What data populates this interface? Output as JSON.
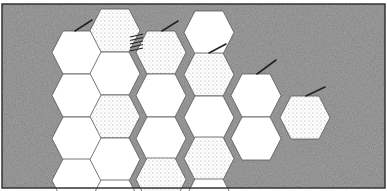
{
  "figure": {
    "title": "",
    "frame": {
      "x": 2,
      "y": 4,
      "width": 383,
      "height": 184
    },
    "colors": {
      "background": "#9a9a9a",
      "background_dark": "#7e7e7e",
      "cell_white": "#ffffff",
      "cell_dotted": "#e6e6e6",
      "cell_outline": "#555555",
      "frame_border": "#333333",
      "stroke": "#222222"
    },
    "hex": {
      "width": 50,
      "height": 43
    },
    "cells": [
      {
        "col": 1,
        "x": 52,
        "y": 31,
        "fill": "white"
      },
      {
        "col": 1,
        "x": 52,
        "y": 74,
        "fill": "white"
      },
      {
        "col": 1,
        "x": 52,
        "y": 117,
        "fill": "white"
      },
      {
        "col": 1,
        "x": 52,
        "y": 159,
        "fill": "white"
      },
      {
        "col": 2,
        "x": 90,
        "y": 9,
        "fill": "dotted"
      },
      {
        "col": 2,
        "x": 90,
        "y": 52,
        "fill": "white"
      },
      {
        "col": 2,
        "x": 90,
        "y": 95,
        "fill": "dotted"
      },
      {
        "col": 2,
        "x": 90,
        "y": 138,
        "fill": "white"
      },
      {
        "col": 2,
        "x": 90,
        "y": 180,
        "fill": "white"
      },
      {
        "col": 3,
        "x": 136,
        "y": 31,
        "fill": "dotted"
      },
      {
        "col": 3,
        "x": 136,
        "y": 74,
        "fill": "white"
      },
      {
        "col": 3,
        "x": 136,
        "y": 117,
        "fill": "white"
      },
      {
        "col": 3,
        "x": 136,
        "y": 158,
        "fill": "dotted"
      },
      {
        "col": 4,
        "x": 184,
        "y": 11,
        "fill": "white"
      },
      {
        "col": 4,
        "x": 184,
        "y": 53,
        "fill": "dotted"
      },
      {
        "col": 4,
        "x": 184,
        "y": 96,
        "fill": "white"
      },
      {
        "col": 4,
        "x": 184,
        "y": 137,
        "fill": "dotted"
      },
      {
        "col": 4,
        "x": 184,
        "y": 179,
        "fill": "white"
      },
      {
        "col": 5,
        "x": 231,
        "y": 74,
        "fill": "white"
      },
      {
        "col": 5,
        "x": 231,
        "y": 117,
        "fill": "white"
      },
      {
        "col": 6,
        "x": 280,
        "y": 96,
        "fill": "dotted"
      }
    ],
    "strokes": [
      {
        "x1": 75,
        "y1": 31,
        "x2": 92,
        "y2": 20
      },
      {
        "x1": 162,
        "y1": 31,
        "x2": 178,
        "y2": 21
      },
      {
        "x1": 209,
        "y1": 53,
        "x2": 226,
        "y2": 44
      },
      {
        "x1": 257,
        "y1": 74,
        "x2": 276,
        "y2": 60
      },
      {
        "x1": 306,
        "y1": 96,
        "x2": 325,
        "y2": 87
      }
    ],
    "hatch": {
      "x": 130,
      "y": 34,
      "lines": 5,
      "spacing": 3.5
    }
  }
}
